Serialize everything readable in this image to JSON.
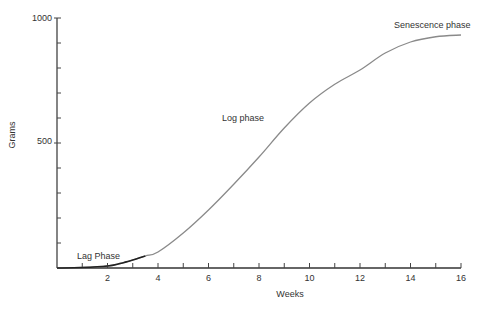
{
  "chart_data": {
    "type": "line",
    "title": "",
    "xlabel": "Weeks",
    "ylabel": "Grams",
    "xlim": [
      0,
      16
    ],
    "ylim": [
      0,
      1000
    ],
    "x_ticks": [
      2,
      4,
      6,
      8,
      10,
      12,
      14,
      16
    ],
    "x_minor_ticks": [
      1,
      3,
      5,
      7,
      9,
      11,
      13,
      15
    ],
    "y_ticks": [
      500,
      1000
    ],
    "y_minor_ticks": [
      100,
      200,
      300,
      400,
      600,
      700,
      800,
      900
    ],
    "grid": false,
    "legend": null,
    "series": [
      {
        "name": "Growth curve",
        "x": [
          0,
          1,
          2,
          2.5,
          3,
          3.5,
          4,
          5,
          6,
          7,
          8,
          9,
          10,
          11,
          12,
          13,
          14,
          15,
          16
        ],
        "values": [
          0,
          2,
          8,
          18,
          32,
          48,
          64,
          140,
          232,
          335,
          444,
          560,
          660,
          735,
          792,
          860,
          904,
          925,
          932
        ]
      }
    ],
    "annotations": [
      {
        "text": "Lag Phase",
        "x": 1.0,
        "y": 60
      },
      {
        "text": "Log phase",
        "x": 6.5,
        "y": 500
      },
      {
        "text": "Senescence phase",
        "x": 13.2,
        "y": 960
      }
    ]
  },
  "labels": {
    "xlabel": "Weeks",
    "ylabel": "Grams",
    "y_top": "1000",
    "y_mid": "500",
    "lag": "Lag Phase",
    "log": "Log phase",
    "senescence": "Senescence phase"
  }
}
